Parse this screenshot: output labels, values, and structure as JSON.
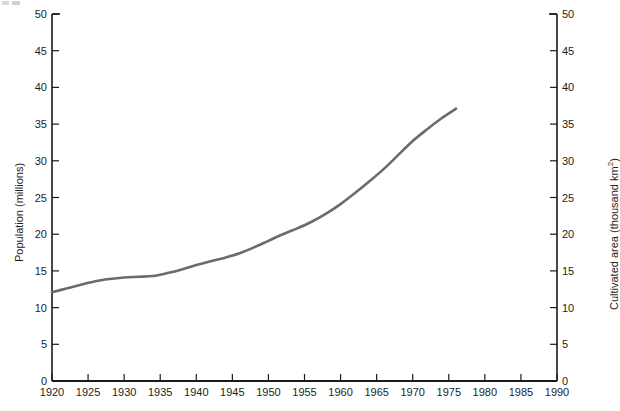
{
  "chart_data": {
    "type": "line",
    "title": "",
    "xlabel": "",
    "ylabel": "Population (millions)",
    "y2label": "Cultivated area (thousand km²)",
    "xlim": [
      1920,
      1990
    ],
    "ylim": [
      0,
      50
    ],
    "y2lim": [
      0,
      50
    ],
    "grid": false,
    "legend": null,
    "xticks": [
      1920,
      1925,
      1930,
      1935,
      1940,
      1945,
      1950,
      1955,
      1960,
      1965,
      1970,
      1975,
      1980,
      1985,
      1990
    ],
    "xticklabels": [
      "1920",
      "1925",
      "1930",
      "1935",
      "1940",
      "1945",
      "1950",
      "1955",
      "1960",
      "1965",
      "1970",
      "1975",
      "1980",
      "1985",
      "1990"
    ],
    "yticks": [
      0,
      5,
      10,
      15,
      20,
      25,
      30,
      35,
      40,
      45,
      50
    ],
    "yticklabels": [
      "0",
      "5",
      "10",
      "15",
      "20",
      "25",
      "30",
      "35",
      "40",
      "45",
      "50"
    ],
    "y2ticks": [
      0,
      5,
      10,
      15,
      20,
      25,
      30,
      35,
      40,
      45,
      50
    ],
    "y2ticklabels": [
      "0",
      "5",
      "10",
      "15",
      "20",
      "25",
      "30",
      "35",
      "40",
      "45",
      "50"
    ],
    "series": [
      {
        "name": "Population / cultivated area",
        "color": "#6b6b6b",
        "linewidth": 2.6,
        "x": [
          1920,
          1922,
          1924,
          1926,
          1928,
          1930,
          1932,
          1934,
          1936,
          1938,
          1940,
          1942,
          1944,
          1946,
          1948,
          1950,
          1952,
          1954,
          1956,
          1958,
          1960,
          1962,
          1964,
          1966,
          1968,
          1970,
          1972,
          1974,
          1976
        ],
        "values": [
          12.1,
          12.6,
          13.1,
          13.6,
          13.9,
          14.1,
          14.2,
          14.3,
          14.7,
          15.2,
          15.8,
          16.3,
          16.8,
          17.4,
          18.2,
          19.1,
          20.0,
          20.8,
          21.7,
          22.8,
          24.1,
          25.6,
          27.2,
          28.9,
          30.8,
          32.7,
          34.3,
          35.8,
          37.1
        ]
      }
    ]
  },
  "axes": {
    "y_left_title": "Population (millions)",
    "y_right_title_main": "Cultivated area (thousand km",
    "y_right_title_sup": "2",
    "y_right_title_tail": ")"
  }
}
